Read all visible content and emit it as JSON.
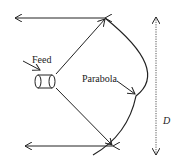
{
  "diagram": {
    "labels": {
      "feed": "Feed",
      "parabola": "Parabola",
      "diameter": "D"
    },
    "colors": {
      "stroke": "#222222",
      "dashed": "#555555",
      "background": "#ffffff"
    }
  }
}
